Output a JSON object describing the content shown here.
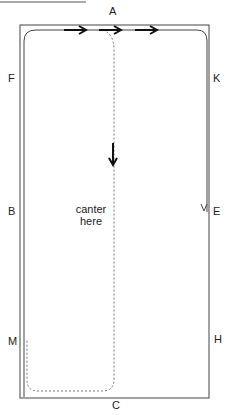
{
  "diagram": {
    "title": "",
    "letters": {
      "A": "A",
      "K": "K",
      "E": "E",
      "H": "H",
      "C": "C",
      "M": "M",
      "B": "B",
      "F": "F"
    },
    "note_line1": "canter",
    "note_line2": "here",
    "colors": {
      "line": "#333333",
      "dashed": "#777777",
      "arrow": "#111111"
    }
  }
}
